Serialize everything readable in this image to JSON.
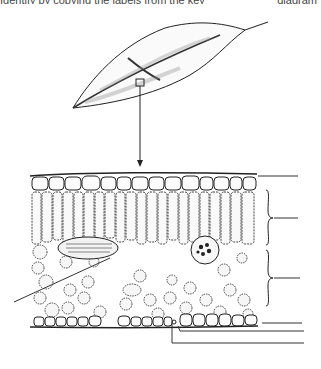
{
  "header": {
    "left_text": "Identify by copying the labels from the key",
    "right_text": "diagram"
  },
  "diagram": {
    "colors": {
      "ink": "#1a1a1a",
      "cell_fill": "#f7f7f7",
      "line": "#333333"
    },
    "labels": [
      {
        "id": "upper-epidermis",
        "text": ""
      },
      {
        "id": "palisade-layer",
        "text": ""
      },
      {
        "id": "spongy-layer",
        "text": ""
      },
      {
        "id": "lower-epidermis",
        "text": ""
      },
      {
        "id": "guard-cell",
        "text": ""
      },
      {
        "id": "stoma",
        "text": ""
      },
      {
        "id": "vein",
        "text": ""
      }
    ]
  }
}
